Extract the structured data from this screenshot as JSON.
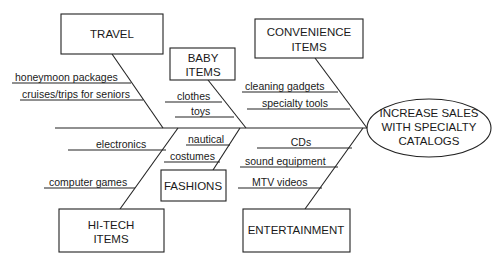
{
  "diagram": {
    "type": "fishbone",
    "effect": {
      "lines": [
        "INCREASE SALES",
        "WITH SPECIALTY",
        "CATALOGS"
      ]
    },
    "categories": [
      {
        "id": "travel",
        "lines": [
          "TRAVEL"
        ],
        "side": "top",
        "causes": [
          "honeymoon packages",
          "cruises/trips for seniors"
        ]
      },
      {
        "id": "baby-items",
        "lines": [
          "BABY",
          "ITEMS"
        ],
        "side": "top",
        "causes": [
          "clothes",
          "toys"
        ]
      },
      {
        "id": "convenience-items",
        "lines": [
          "CONVENIENCE",
          "ITEMS"
        ],
        "side": "top",
        "causes": [
          "cleaning gadgets",
          "specialty tools"
        ]
      },
      {
        "id": "hi-tech-items",
        "lines": [
          "HI-TECH",
          "ITEMS"
        ],
        "side": "bottom",
        "causes": [
          "electronics",
          "computer games"
        ]
      },
      {
        "id": "fashions",
        "lines": [
          "FASHIONS"
        ],
        "side": "bottom",
        "causes": [
          "nautical",
          "costumes"
        ]
      },
      {
        "id": "entertainment",
        "lines": [
          "ENTERTAINMENT"
        ],
        "side": "bottom",
        "causes": [
          "CDs",
          "sound equipment",
          "MTV videos"
        ]
      }
    ]
  }
}
